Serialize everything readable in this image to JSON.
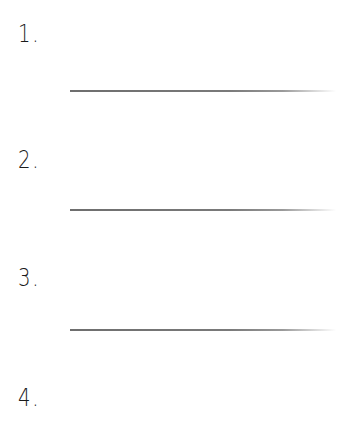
{
  "worksheet": {
    "items": [
      {
        "label": "1.",
        "has_answer_line": true
      },
      {
        "label": "2.",
        "has_answer_line": true
      },
      {
        "label": "3.",
        "has_answer_line": true
      },
      {
        "label": "4.",
        "has_answer_line": false
      }
    ],
    "line_color": "#777777",
    "text_color": "#1a1a1a"
  }
}
